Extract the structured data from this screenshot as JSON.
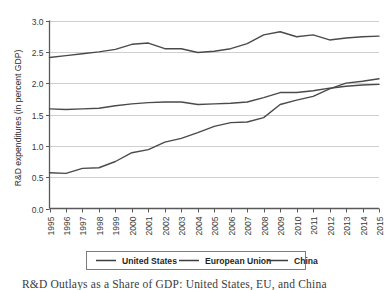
{
  "chart_data": {
    "type": "line",
    "title": "",
    "xlabel": "",
    "ylabel": "R&D expenditures (in percent GDP)",
    "ylim": [
      0.0,
      3.0
    ],
    "ytick_labels": [
      "0.0",
      "0.5",
      "1.0",
      "1.5",
      "2.0",
      "2.5",
      "3.0"
    ],
    "ytick_values": [
      0.0,
      0.5,
      1.0,
      1.5,
      2.0,
      2.5,
      3.0
    ],
    "grid": true,
    "legend_position": "bottom",
    "categories": [
      "1995",
      "1996",
      "1997",
      "1998",
      "1999",
      "2000",
      "2001",
      "2002",
      "2003",
      "2004",
      "2005",
      "2006",
      "2007",
      "2008",
      "2009",
      "2010",
      "2011",
      "2012",
      "2013",
      "2014",
      "2015"
    ],
    "series": [
      {
        "name": "United States",
        "values": [
          2.41,
          2.44,
          2.47,
          2.5,
          2.54,
          2.62,
          2.64,
          2.55,
          2.55,
          2.49,
          2.51,
          2.55,
          2.63,
          2.77,
          2.82,
          2.74,
          2.77,
          2.69,
          2.72,
          2.74,
          2.75
        ]
      },
      {
        "name": "European Union",
        "values": [
          1.59,
          1.58,
          1.59,
          1.6,
          1.64,
          1.67,
          1.69,
          1.7,
          1.7,
          1.66,
          1.67,
          1.68,
          1.7,
          1.77,
          1.85,
          1.85,
          1.88,
          1.92,
          1.95,
          1.97,
          1.98
        ]
      },
      {
        "name": "China",
        "values": [
          0.57,
          0.56,
          0.64,
          0.65,
          0.75,
          0.89,
          0.94,
          1.06,
          1.12,
          1.21,
          1.31,
          1.37,
          1.38,
          1.45,
          1.66,
          1.73,
          1.79,
          1.91,
          2.0,
          2.03,
          2.07
        ]
      }
    ],
    "legend_entries": [
      "United States",
      "European Union",
      "China"
    ],
    "colors": {
      "series_line": "#4a4a4a",
      "gridline": "#c9c9c9",
      "axis": "#5a5a5a",
      "text": "#2b2b2b"
    }
  },
  "caption": {
    "text": "R&D Outlays as a Share of GDP: United States, EU, and China"
  }
}
